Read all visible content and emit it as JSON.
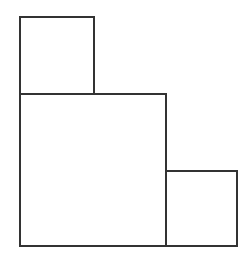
{
  "diagram": {
    "stroke_color": "#333333",
    "background": "#ffffff",
    "shapes": [
      {
        "name": "top-small-square",
        "x": 20,
        "y": 17,
        "w": 74,
        "h": 77
      },
      {
        "name": "large-square",
        "x": 20,
        "y": 94,
        "w": 146,
        "h": 152
      },
      {
        "name": "right-small-square",
        "x": 166,
        "y": 171,
        "w": 71,
        "h": 75
      }
    ]
  }
}
